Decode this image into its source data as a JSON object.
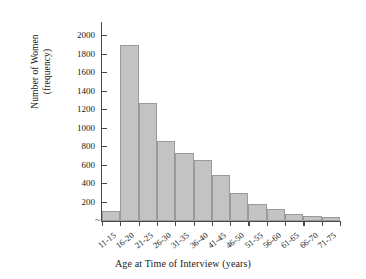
{
  "chart_data": {
    "type": "bar",
    "title": "",
    "xlabel": "Age at Time of Interview (years)",
    "ylabel_line1": "Number of Women",
    "ylabel_line2": "(frequency)",
    "categories": [
      "11-15",
      "16-20",
      "21-25",
      "26-30",
      "31-35",
      "36-40",
      "41-45",
      "46-50",
      "51-55",
      "56-60",
      "61-65",
      "66-70",
      "71-75"
    ],
    "values": [
      100,
      1900,
      1270,
      860,
      730,
      650,
      490,
      300,
      180,
      130,
      70,
      45,
      35
    ],
    "ylim": [
      0,
      2100
    ],
    "yticks": [
      200,
      400,
      600,
      800,
      1000,
      1200,
      1400,
      1600,
      1800,
      2000
    ],
    "ytick_labels": [
      "200",
      "400",
      "600",
      "800",
      "1000",
      "1200",
      "1400",
      "1600",
      "1800",
      "2000"
    ],
    "grid": false,
    "legend": false,
    "bar_fill": "#c3c3c3",
    "bar_stroke": "#9a9a9a",
    "axis_color": "#4a4a4a",
    "axis_break_marker": "~"
  }
}
